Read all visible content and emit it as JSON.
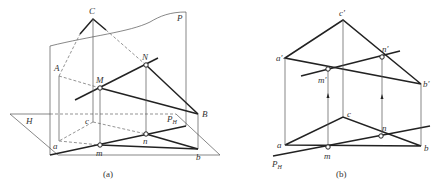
{
  "figure_a": {
    "caption": "(a)",
    "labels": {
      "C": "C",
      "P": "P",
      "A": "A",
      "M": "M",
      "N": "N",
      "B": "B",
      "H": "H",
      "c": "c",
      "Pu_main": "P",
      "Pu_sub": "H",
      "a": "a",
      "m": "m",
      "n": "n",
      "b": "b"
    }
  },
  "figure_b": {
    "caption": "(b)",
    "labels": {
      "c_prime": "c′",
      "a_prime": "a′",
      "n_prime": "n′",
      "m_prime": "m′",
      "b_prime": "b′",
      "c": "c",
      "a": "a",
      "m": "m",
      "n": "n",
      "b": "b",
      "Pu_main": "P",
      "Pu_sub": "H"
    }
  }
}
